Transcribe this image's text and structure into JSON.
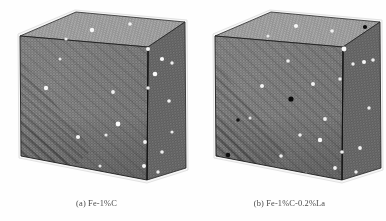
{
  "figure": {
    "kind": "molecular-dynamics-simulation-cells",
    "background_color": "#fefefe",
    "panel_count": 2
  },
  "panels": [
    {
      "id": "panel-a",
      "caption": "(a) Fe-1%C",
      "label": "(a)",
      "composition": "Fe-1%C",
      "cube": {
        "front_face_fill": "#6f6f6f",
        "top_face_fill": "#8a8a8a",
        "side_face_fill": "#5d5d5d",
        "edge_color": "#1c1c1c",
        "rim_color": "#f2f2f2"
      },
      "species": [
        {
          "name": "iron-matrix-atom",
          "symbol": "Fe",
          "color": "#6f6f6f",
          "role": "matrix"
        },
        {
          "name": "carbon-atom",
          "symbol": "C",
          "color": "#f4f4f4",
          "role": "solute",
          "count_visible": 21
        }
      ],
      "carbon_atoms": [
        {
          "x": 92,
          "y": 30,
          "r": 2.2,
          "face": "top"
        },
        {
          "x": 130,
          "y": 24,
          "r": 1.8,
          "face": "top"
        },
        {
          "x": 66,
          "y": 39,
          "r": 1.6,
          "face": "top"
        },
        {
          "x": 148,
          "y": 49,
          "r": 2.0,
          "face": "side"
        },
        {
          "x": 162,
          "y": 59,
          "r": 2.1,
          "face": "side"
        },
        {
          "x": 172,
          "y": 63,
          "r": 1.7,
          "face": "side"
        },
        {
          "x": 155,
          "y": 74,
          "r": 2.3,
          "face": "front"
        },
        {
          "x": 46,
          "y": 88,
          "r": 2.2,
          "face": "front"
        },
        {
          "x": 113,
          "y": 92,
          "r": 1.9,
          "face": "front"
        },
        {
          "x": 148,
          "y": 88,
          "r": 1.7,
          "face": "side"
        },
        {
          "x": 169,
          "y": 101,
          "r": 1.8,
          "face": "side"
        },
        {
          "x": 118,
          "y": 124,
          "r": 2.4,
          "face": "front"
        },
        {
          "x": 78,
          "y": 137,
          "r": 2.1,
          "face": "front"
        },
        {
          "x": 106,
          "y": 135,
          "r": 1.6,
          "face": "front"
        },
        {
          "x": 145,
          "y": 142,
          "r": 1.9,
          "face": "front"
        },
        {
          "x": 162,
          "y": 152,
          "r": 1.8,
          "face": "side"
        },
        {
          "x": 144,
          "y": 166,
          "r": 2.0,
          "face": "front"
        },
        {
          "x": 158,
          "y": 172,
          "r": 1.7,
          "face": "side"
        },
        {
          "x": 60,
          "y": 59,
          "r": 1.5,
          "face": "front"
        },
        {
          "x": 100,
          "y": 166,
          "r": 1.5,
          "face": "front"
        },
        {
          "x": 172,
          "y": 132,
          "r": 1.6,
          "face": "side"
        }
      ],
      "lanthanum_atoms": []
    },
    {
      "id": "panel-b",
      "caption": "(b) Fe-1%C-0.2%La",
      "label": "(b)",
      "composition": "Fe-1%C-0.2%La",
      "cube": {
        "front_face_fill": "#6f6f6f",
        "top_face_fill": "#8a8a8a",
        "side_face_fill": "#5d5d5d",
        "edge_color": "#1c1c1c",
        "rim_color": "#f2f2f2"
      },
      "species": [
        {
          "name": "iron-matrix-atom",
          "symbol": "Fe",
          "color": "#6f6f6f",
          "role": "matrix"
        },
        {
          "name": "carbon-atom",
          "symbol": "C",
          "color": "#f4f4f4",
          "role": "solute",
          "count_visible": 22
        },
        {
          "name": "lanthanum-atom",
          "symbol": "La",
          "color": "#0d0d0d",
          "role": "solute",
          "count_visible": 4
        }
      ],
      "carbon_atoms": [
        {
          "x": 103,
          "y": 26,
          "r": 2.1,
          "face": "top"
        },
        {
          "x": 139,
          "y": 31,
          "r": 1.8,
          "face": "top"
        },
        {
          "x": 75,
          "y": 36,
          "r": 1.6,
          "face": "top"
        },
        {
          "x": 151,
          "y": 49,
          "r": 2.4,
          "face": "side"
        },
        {
          "x": 171,
          "y": 62,
          "r": 2.0,
          "face": "side"
        },
        {
          "x": 180,
          "y": 60,
          "r": 1.8,
          "face": "side"
        },
        {
          "x": 160,
          "y": 64,
          "r": 1.7,
          "face": "side"
        },
        {
          "x": 95,
          "y": 61,
          "r": 1.8,
          "face": "front"
        },
        {
          "x": 120,
          "y": 84,
          "r": 2.0,
          "face": "front"
        },
        {
          "x": 69,
          "y": 86,
          "r": 2.0,
          "face": "front"
        },
        {
          "x": 147,
          "y": 79,
          "r": 1.7,
          "face": "side"
        },
        {
          "x": 132,
          "y": 119,
          "r": 1.9,
          "face": "front"
        },
        {
          "x": 107,
          "y": 135,
          "r": 1.8,
          "face": "front"
        },
        {
          "x": 127,
          "y": 140,
          "r": 2.2,
          "face": "front"
        },
        {
          "x": 88,
          "y": 156,
          "r": 1.8,
          "face": "front"
        },
        {
          "x": 149,
          "y": 152,
          "r": 1.8,
          "face": "side"
        },
        {
          "x": 167,
          "y": 148,
          "r": 1.9,
          "face": "side"
        },
        {
          "x": 142,
          "y": 168,
          "r": 1.9,
          "face": "front"
        },
        {
          "x": 163,
          "y": 172,
          "r": 1.7,
          "face": "side"
        },
        {
          "x": 176,
          "y": 108,
          "r": 1.7,
          "face": "side"
        },
        {
          "x": 57,
          "y": 118,
          "r": 1.5,
          "face": "front"
        },
        {
          "x": 113,
          "y": 174,
          "r": 1.5,
          "face": "front"
        }
      ],
      "lanthanum_atoms": [
        {
          "x": 98,
          "y": 99,
          "r": 2.6,
          "face": "front"
        },
        {
          "x": 35,
          "y": 155,
          "r": 2.3,
          "face": "front"
        },
        {
          "x": 45,
          "y": 120,
          "r": 1.8,
          "face": "front"
        },
        {
          "x": 172,
          "y": 27,
          "r": 2.1,
          "face": "top"
        }
      ]
    }
  ]
}
